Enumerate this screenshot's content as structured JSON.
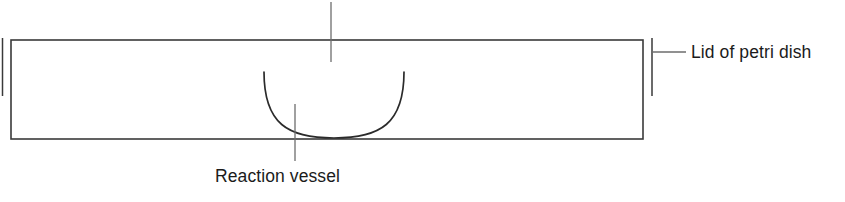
{
  "diagram": {
    "background_color": "#ffffff",
    "stroke_color": "#3a3a3a",
    "text_color": "#1b1b1b",
    "labels": {
      "lid": "Lid of petri dish",
      "vessel": "Reaction vessel"
    },
    "parts": {
      "lid_body_name": "petri-dish-lid-rectangle",
      "lid_rim_left_name": "lid-rim-left",
      "lid_rim_right_name": "lid-rim-right",
      "vessel_name": "reaction-vessel-bowl",
      "center_axis_name": "center-axis-line"
    },
    "geometry": {
      "lid_left": 11,
      "lid_right": 643,
      "lid_top": 40,
      "lid_bottom": 139,
      "rim_left_x": 2,
      "rim_left_top": 38,
      "rim_left_bottom": 96,
      "rim_right_x": 652,
      "rim_right_top": 38,
      "rim_right_bottom": 96,
      "center_axis_x": 331,
      "center_axis_top": 2,
      "center_axis_bottom": 62,
      "vessel_left": 264,
      "vessel_right": 404,
      "vessel_top": 72,
      "vessel_bottom": 138,
      "leader_lid_x1": 652,
      "leader_lid_x2": 686,
      "leader_lid_y": 52,
      "leader_vessel_x": 295,
      "leader_vessel_y1": 104,
      "leader_vessel_y2": 161
    }
  }
}
